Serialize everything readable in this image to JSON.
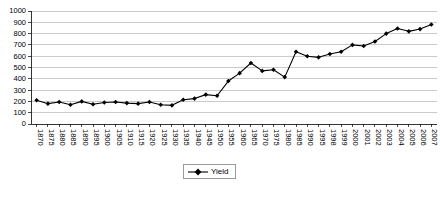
{
  "chart_data": {
    "type": "line",
    "title": "",
    "xlabel": "",
    "ylabel": "",
    "ylim": [
      0,
      1000
    ],
    "ytick_step": 100,
    "yticks": [
      1000,
      900,
      800,
      700,
      600,
      500,
      400,
      300,
      200,
      100,
      0
    ],
    "grid": true,
    "legend_position": "bottom-center",
    "series": [
      {
        "name": "Yield",
        "marker": "diamond",
        "color": "#000000",
        "categories": [
          "1870",
          "1875",
          "1880",
          "1885",
          "1890",
          "1895",
          "1900",
          "1905",
          "1910",
          "1915",
          "1920",
          "1925",
          "1930",
          "1935",
          "1940",
          "1945",
          "1950",
          "1955",
          "1960",
          "1965",
          "1970",
          "1975",
          "1980",
          "1985",
          "1990",
          "1995",
          "1998",
          "1999",
          "2000",
          "2001",
          "2002",
          "2003",
          "2004",
          "2005",
          "2006",
          "2007"
        ],
        "values": [
          210,
          180,
          195,
          170,
          200,
          175,
          190,
          195,
          185,
          180,
          195,
          170,
          165,
          215,
          225,
          260,
          250,
          380,
          450,
          540,
          470,
          480,
          415,
          640,
          600,
          590,
          620,
          640,
          700,
          690,
          730,
          800,
          845,
          820,
          840,
          880
        ]
      }
    ],
    "legend": [
      {
        "label": "Yield"
      }
    ]
  }
}
